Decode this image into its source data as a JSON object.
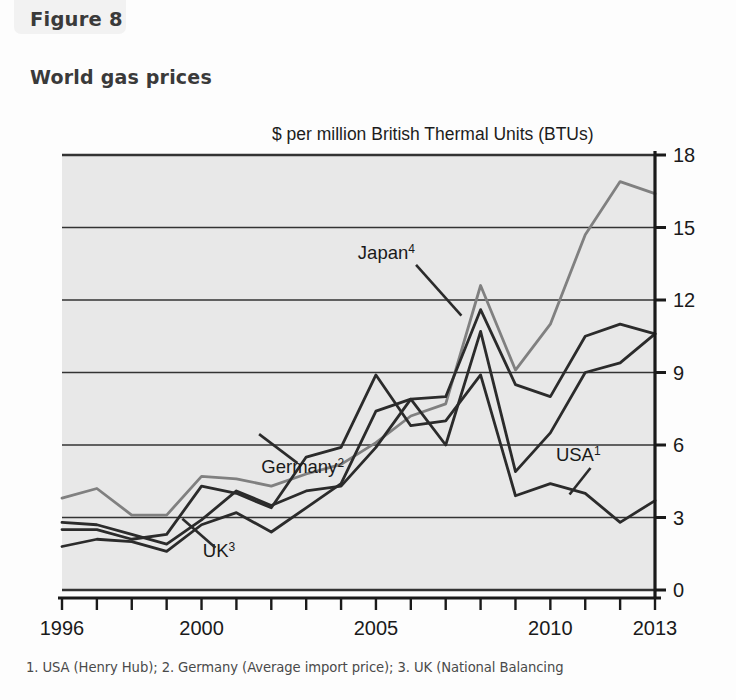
{
  "figure": {
    "tab_label": "Figure 8",
    "title": "World gas prices",
    "subtitle": "$ per million British Thermal Units (BTUs)",
    "footnote": "1. USA (Henry Hub); 2. Germany (Average import price); 3. UK (National Balancing"
  },
  "colors": {
    "plot_background": "#e8e8e8",
    "axis": "#1a1a1a",
    "gridline": "#333333",
    "series_black": "#2b2b2b",
    "series_grey": "#808080",
    "page_background": "#fdfdfd",
    "tab_background": "#f2f2f2",
    "title_text": "#3a3a3a"
  },
  "chart_data": {
    "type": "line",
    "title": "World gas prices",
    "subtitle": "$ per million British Thermal Units (BTUs)",
    "xlabel": "",
    "ylabel": "$ per million British Thermal Units (BTUs)",
    "xlim": [
      1996,
      2013
    ],
    "ylim": [
      0,
      18
    ],
    "yticks": [
      0,
      3,
      6,
      9,
      12,
      15,
      18
    ],
    "ytick_labels": [
      "0",
      "3",
      "6",
      "9",
      "12",
      "15",
      "18"
    ],
    "y_axis_position": "right",
    "xticks": [
      1996,
      1997,
      1998,
      1999,
      2000,
      2001,
      2002,
      2003,
      2004,
      2005,
      2006,
      2007,
      2008,
      2009,
      2010,
      2011,
      2012,
      2013
    ],
    "xtick_labels_shown": [
      "1996",
      "2000",
      "2005",
      "2010",
      "2013"
    ],
    "xtick_labels_shown_at": [
      1996,
      2000,
      2005,
      2010,
      2013
    ],
    "grid": "horizontal",
    "legend": "inline-annotations",
    "x": [
      1996,
      1997,
      1998,
      1999,
      2000,
      2001,
      2002,
      2003,
      2004,
      2005,
      2006,
      2007,
      2008,
      2009,
      2010,
      2011,
      2012,
      2013
    ],
    "series": [
      {
        "name": "Japan",
        "footnote_marker": "4",
        "label": "Japan⁴",
        "color": "#808080",
        "values": [
          3.8,
          4.2,
          3.1,
          3.1,
          4.7,
          4.6,
          4.3,
          4.8,
          5.2,
          6.1,
          7.2,
          7.7,
          12.6,
          9.1,
          11.0,
          14.7,
          16.9,
          16.4
        ]
      },
      {
        "name": "Germany",
        "footnote_marker": "2",
        "label": "Germany²",
        "color": "#2b2b2b",
        "values": [
          2.8,
          2.7,
          2.3,
          1.9,
          2.9,
          4.1,
          3.5,
          4.1,
          4.3,
          5.9,
          7.9,
          8.0,
          11.6,
          8.5,
          8.0,
          10.5,
          11.0,
          10.6
        ]
      },
      {
        "name": "UK",
        "footnote_marker": "3",
        "label": "UK³",
        "color": "#2b2b2b",
        "values": [
          1.8,
          2.1,
          2.0,
          1.6,
          2.7,
          3.2,
          2.4,
          3.4,
          4.4,
          7.4,
          7.9,
          6.0,
          10.7,
          4.9,
          6.5,
          9.0,
          9.4,
          10.6
        ]
      },
      {
        "name": "USA",
        "footnote_marker": "1",
        "label": "USA¹",
        "color": "#2b2b2b",
        "values": [
          2.5,
          2.5,
          2.1,
          2.3,
          4.3,
          4.0,
          3.4,
          5.5,
          5.9,
          8.9,
          6.8,
          7.0,
          8.9,
          3.9,
          4.4,
          4.0,
          2.8,
          3.7
        ]
      }
    ],
    "annotations": [
      {
        "text": "Japan⁴",
        "x": 2005.3,
        "y": 13.7
      },
      {
        "text": "Germany²",
        "x": 2002.9,
        "y": 4.85
      },
      {
        "text": "USA¹",
        "x": 2010.8,
        "y": 5.35
      },
      {
        "text": "UK³",
        "x": 2000.5,
        "y": 1.35
      }
    ]
  }
}
